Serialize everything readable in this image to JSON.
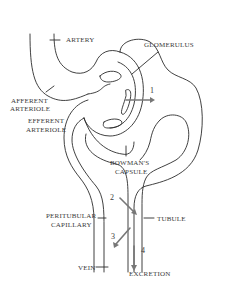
{
  "diagram": {
    "type": "anatomical-schematic",
    "colors": {
      "line": "#2b2b2b",
      "arrow": "#777777",
      "text": "#3a3a3a",
      "background": "#ffffff"
    },
    "labels": {
      "artery": "ARTERY",
      "glomerulus": "GLOMERULUS",
      "afferent_1": "AFFERENT",
      "afferent_2": "ARTERIOLE",
      "efferent_1": "EFFERENT",
      "efferent_2": "ARTERIOLE",
      "bowmans_1": "BOWMAN'S",
      "bowmans_2": "CAPSULE",
      "peritubular_1": "PERITUBULAR",
      "peritubular_2": "CAPILLARY",
      "tubule": "TUBULE",
      "vein": "VEIN",
      "excretion": "EXCRETION"
    },
    "process_numbers": {
      "n1": "1",
      "n2": "2",
      "n3": "3",
      "n4": "4"
    }
  }
}
